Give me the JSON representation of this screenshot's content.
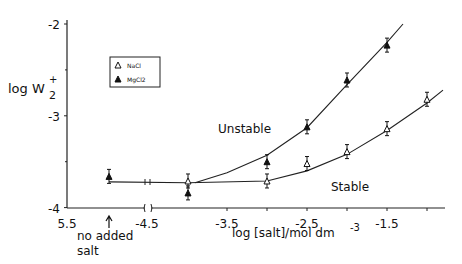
{
  "chart_data": {
    "type": "scatter",
    "title": "",
    "ylabel_main": "log W",
    "ylabel_sup": "+",
    "ylabel_sub": "2",
    "xlabel": "log [salt]/mol dm",
    "xlabel_sup": "-3",
    "ylim": [
      -4,
      -2
    ],
    "yticks": [
      {
        "v": -2,
        "label": "-2"
      },
      {
        "v": -3,
        "label": "-3"
      },
      {
        "v": -4,
        "label": "-4"
      }
    ],
    "xticks": [
      {
        "v": -5.5,
        "label": "5.5"
      },
      {
        "v": -4.5,
        "label": "-4.5"
      },
      {
        "v": -3.5,
        "label": "-3.5"
      },
      {
        "v": -2.5,
        "label": "-2.5"
      },
      {
        "v": -1.5,
        "label": "-1.5"
      }
    ],
    "no_salt_label": [
      "no added",
      "salt"
    ],
    "legend": [
      {
        "name": "NaCl",
        "marker": "open-triangle"
      },
      {
        "name": "MgCl2",
        "marker": "filled-triangle"
      }
    ],
    "legend_position": "top-left",
    "annotations": [
      {
        "text": "Unstable",
        "x": -3.1,
        "y": -3.15
      },
      {
        "text": "Stable",
        "x": -2.1,
        "y": -3.82
      }
    ],
    "series": [
      {
        "name": "NaCl",
        "points": [
          {
            "x": -4.0,
            "y": -3.71
          },
          {
            "x": -3.0,
            "y": -3.71
          },
          {
            "x": -2.5,
            "y": -3.52
          },
          {
            "x": -2.0,
            "y": -3.39
          },
          {
            "x": -1.5,
            "y": -3.14
          },
          {
            "x": -1.0,
            "y": -2.82
          }
        ]
      },
      {
        "name": "MgCl2",
        "points": [
          {
            "x": "no added salt",
            "y": -3.66
          },
          {
            "x": -4.0,
            "y": -3.84
          },
          {
            "x": -3.0,
            "y": -3.5
          },
          {
            "x": -2.5,
            "y": -3.12
          },
          {
            "x": -2.0,
            "y": -2.61
          },
          {
            "x": -1.5,
            "y": -2.23
          }
        ]
      }
    ],
    "curves": [
      {
        "name": "NaCl-fit",
        "points": [
          [
            -5.0,
            -3.72
          ],
          [
            -4.0,
            -3.73
          ],
          [
            -3.0,
            -3.71
          ],
          [
            -2.5,
            -3.6
          ],
          [
            -2.0,
            -3.42
          ],
          [
            -1.5,
            -3.16
          ],
          [
            -1.0,
            -2.86
          ],
          [
            -0.8,
            -2.72
          ]
        ]
      },
      {
        "name": "MgCl2-fit",
        "points": [
          [
            -3.9,
            -3.73
          ],
          [
            -3.5,
            -3.62
          ],
          [
            -3.0,
            -3.43
          ],
          [
            -2.5,
            -3.13
          ],
          [
            -2.0,
            -2.66
          ],
          [
            -1.5,
            -2.2
          ],
          [
            -1.3,
            -2.0
          ]
        ]
      }
    ]
  }
}
